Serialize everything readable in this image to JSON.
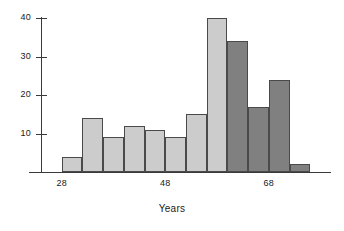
{
  "chart_data": {
    "type": "bar",
    "title": "",
    "subtitle": "",
    "xlabel": "Years",
    "ylabel": "",
    "grid": false,
    "legend": false,
    "ylim": [
      0,
      42
    ],
    "xlim": [
      24,
      80
    ],
    "bin_width": 4,
    "y_ticks": [
      10,
      20,
      30,
      40
    ],
    "y_tick_labels": [
      "10",
      "20",
      "30",
      "40"
    ],
    "x_ticks": [
      28,
      48,
      68
    ],
    "x_tick_labels": [
      "28",
      "48",
      "68"
    ],
    "colors": {
      "light_bar": "#cccccc",
      "dark_bar": "#808080",
      "bar_edge": "#4a4a4a",
      "axis": "#3a3a3a",
      "text": "#1a1a1a",
      "background": "#ffffff"
    },
    "bins": [
      {
        "x_left": 28,
        "x_right": 32,
        "value": 4,
        "color": "light"
      },
      {
        "x_left": 32,
        "x_right": 36,
        "value": 14,
        "color": "light"
      },
      {
        "x_left": 36,
        "x_right": 40,
        "value": 9,
        "color": "light"
      },
      {
        "x_left": 40,
        "x_right": 44,
        "value": 12,
        "color": "light"
      },
      {
        "x_left": 44,
        "x_right": 48,
        "value": 11,
        "color": "light"
      },
      {
        "x_left": 48,
        "x_right": 52,
        "value": 9,
        "color": "light"
      },
      {
        "x_left": 52,
        "x_right": 56,
        "value": 15,
        "color": "light"
      },
      {
        "x_left": 56,
        "x_right": 60,
        "value": 40,
        "color": "light"
      },
      {
        "x_left": 60,
        "x_right": 64,
        "value": 34,
        "color": "dark"
      },
      {
        "x_left": 64,
        "x_right": 68,
        "value": 17,
        "color": "dark"
      },
      {
        "x_left": 68,
        "x_right": 72,
        "value": 24,
        "color": "dark"
      },
      {
        "x_left": 72,
        "x_right": 76,
        "value": 2,
        "color": "dark"
      }
    ],
    "categories": [
      "28-32",
      "32-36",
      "36-40",
      "40-44",
      "44-48",
      "48-52",
      "52-56",
      "56-60",
      "60-64",
      "64-68",
      "68-72",
      "72-76"
    ],
    "values": [
      4,
      14,
      9,
      12,
      11,
      9,
      15,
      40,
      34,
      17,
      24,
      2
    ]
  }
}
